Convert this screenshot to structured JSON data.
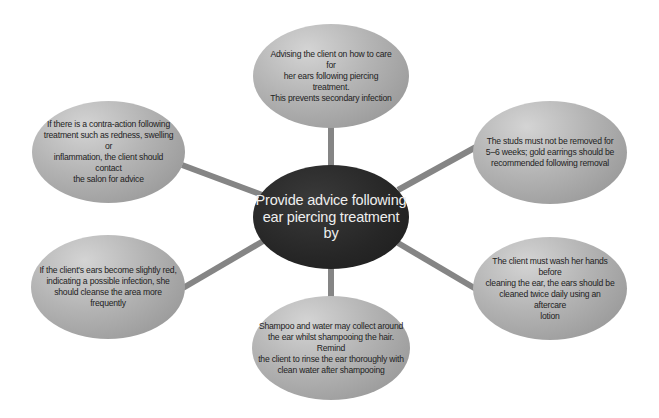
{
  "diagram": {
    "type": "spider-diagram",
    "connector_color": "#858585",
    "hub": {
      "label": "Provide advice following ear piercing treatment by",
      "lines": [
        "Provide advice following",
        "ear piercing treatment",
        "by"
      ],
      "fill": "#262626",
      "text_color": "#eeeeee"
    },
    "nodes": [
      {
        "id": "top",
        "lines": [
          "Advising the client on how to care for",
          "her ears following piercing treatment.",
          "This prevents secondary infection"
        ]
      },
      {
        "id": "upper-right",
        "lines": [
          "The studs must not be removed for",
          "5–6 weeks; gold earrings should be",
          "recommended following removal"
        ]
      },
      {
        "id": "lower-right",
        "lines": [
          "The client must wash her hands before",
          "cleaning the ear, the ears should be",
          "cleaned twice daily using an aftercare",
          "lotion"
        ]
      },
      {
        "id": "bottom",
        "lines": [
          "Shampoo and water may collect around",
          "the ear whilst shampooing the hair. Remind",
          "the client to rinse the ear thoroughly with",
          "clean water after shampooing"
        ]
      },
      {
        "id": "lower-left",
        "lines": [
          "If the client's ears become slightly red,",
          "indicating a possible infection, she",
          "should cleanse the area more frequently"
        ]
      },
      {
        "id": "upper-left",
        "lines": [
          "If there is a contra-action following",
          "treatment such as redness, swelling or",
          "inflammation, the client should contact",
          "the salon for advice"
        ]
      }
    ]
  }
}
